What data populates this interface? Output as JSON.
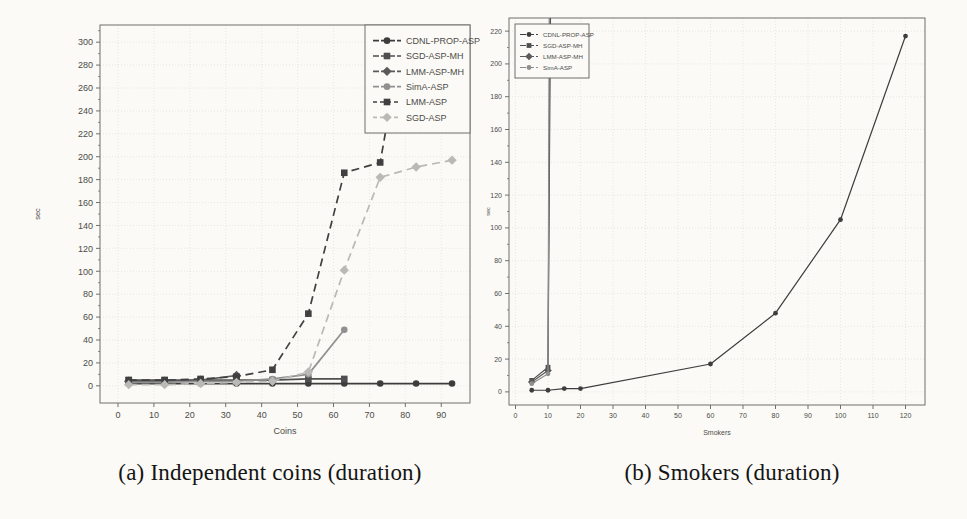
{
  "figure": {
    "background": "#fbfaf7",
    "grid_color": "#e3e2dc",
    "axis_color": "#6f6f6b",
    "tick_text_color": "#4c4c48"
  },
  "chart_data": [
    {
      "id": "independent-coins",
      "type": "line",
      "caption": "(a) Independent coins (duration)",
      "xlabel": "Coins",
      "ylabel": "sec",
      "xlim": [
        -5,
        98
      ],
      "ylim": [
        -15,
        315
      ],
      "xticks": [
        0,
        10,
        20,
        30,
        40,
        50,
        60,
        70,
        80,
        90
      ],
      "yticks": [
        0,
        20,
        40,
        60,
        80,
        100,
        120,
        140,
        160,
        180,
        200,
        220,
        240,
        260,
        280,
        300
      ],
      "y_minor_step": 10,
      "grid": true,
      "legend_position": "top-right",
      "series": [
        {
          "name": "CDNL-PROP-ASP",
          "marker": "circle",
          "dash": "solid",
          "color": "#3d3d3d",
          "points": [
            [
              3,
              2
            ],
            [
              13,
              2
            ],
            [
              23,
              2
            ],
            [
              33,
              2
            ],
            [
              43,
              2
            ],
            [
              53,
              2
            ],
            [
              63,
              2
            ],
            [
              73,
              2
            ],
            [
              83,
              2
            ],
            [
              93,
              2
            ]
          ]
        },
        {
          "name": "SGD-ASP-MH",
          "marker": "square",
          "dash": "solid",
          "color": "#4f4f4f",
          "points": [
            [
              3,
              5
            ],
            [
              13,
              5
            ],
            [
              23,
              5
            ],
            [
              33,
              5
            ],
            [
              43,
              5
            ],
            [
              53,
              6
            ],
            [
              63,
              6
            ]
          ]
        },
        {
          "name": "LMM-ASP-MH",
          "marker": "diamond",
          "dash": "solid",
          "color": "#5a5a5a",
          "points": [
            [
              3,
              4
            ],
            [
              13,
              4
            ],
            [
              23,
              5
            ],
            [
              33,
              9
            ]
          ]
        },
        {
          "name": "SimA-ASP",
          "marker": "circle",
          "dash": "solid",
          "color": "#909090",
          "points": [
            [
              3,
              3
            ],
            [
              13,
              3
            ],
            [
              23,
              4
            ],
            [
              33,
              4
            ],
            [
              43,
              6
            ],
            [
              53,
              10
            ],
            [
              63,
              49
            ]
          ]
        },
        {
          "name": "LMM-ASP",
          "marker": "square",
          "dash": "dashed",
          "color": "#404040",
          "points": [
            [
              3,
              5
            ],
            [
              13,
              5
            ],
            [
              23,
              6
            ],
            [
              33,
              8
            ],
            [
              43,
              14
            ],
            [
              53,
              63
            ],
            [
              63,
              186
            ],
            [
              73,
              195
            ],
            [
              80,
              320
            ]
          ]
        },
        {
          "name": "SGD-ASP",
          "marker": "diamond",
          "dash": "dashed",
          "color": "#b9b9b5",
          "points": [
            [
              3,
              1
            ],
            [
              13,
              1
            ],
            [
              23,
              2
            ],
            [
              33,
              3
            ],
            [
              43,
              4
            ],
            [
              53,
              12
            ],
            [
              63,
              101
            ],
            [
              73,
              182
            ],
            [
              83,
              191
            ],
            [
              93,
              197
            ]
          ]
        }
      ]
    },
    {
      "id": "smokers",
      "type": "line",
      "caption": "(b) Smokers (duration)",
      "xlabel": "Smokers",
      "ylabel": "sec",
      "xlim": [
        -2,
        126
      ],
      "ylim": [
        -8,
        228
      ],
      "xticks": [
        0,
        10,
        20,
        30,
        40,
        50,
        60,
        70,
        80,
        90,
        100,
        110,
        120
      ],
      "yticks": [
        0,
        20,
        40,
        60,
        80,
        100,
        120,
        140,
        160,
        180,
        200,
        220
      ],
      "y_minor_step": 10,
      "grid": true,
      "legend_position": "top-left",
      "series": [
        {
          "name": "CDNL-PROP-ASP",
          "marker": "circle",
          "dash": "solid",
          "color": "#3d3d3d",
          "points": [
            [
              5,
              1
            ],
            [
              10,
              1
            ],
            [
              15,
              2
            ],
            [
              20,
              2
            ],
            [
              60,
              17
            ],
            [
              80,
              48
            ],
            [
              100,
              105
            ],
            [
              120,
              217
            ]
          ]
        },
        {
          "name": "SGD-ASP-MH",
          "marker": "square",
          "dash": "solid",
          "color": "#4f4f4f",
          "points": [
            [
              5,
              7
            ],
            [
              10,
              15
            ],
            [
              10.8,
              240
            ]
          ]
        },
        {
          "name": "LMM-ASP-MH",
          "marker": "diamond",
          "dash": "solid",
          "color": "#5a5a5a",
          "points": [
            [
              5,
              6
            ],
            [
              10,
              13
            ],
            [
              10.6,
              240
            ]
          ]
        },
        {
          "name": "SimA-ASP",
          "marker": "circle",
          "dash": "solid",
          "color": "#8f8f8f",
          "points": [
            [
              5,
              5
            ],
            [
              10,
              11
            ],
            [
              10.4,
              240
            ]
          ]
        }
      ]
    }
  ]
}
